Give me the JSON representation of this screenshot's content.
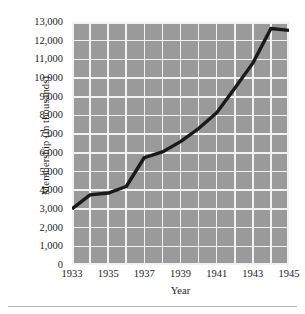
{
  "chart_data": {
    "type": "line",
    "title": "",
    "xlabel": "Year",
    "ylabel": "Membership (in thousands)",
    "x": [
      1933,
      1934,
      1935,
      1936,
      1937,
      1938,
      1939,
      1940,
      1941,
      1942,
      1943,
      1944,
      1945
    ],
    "values": [
      3000,
      3750,
      3850,
      4200,
      5750,
      6050,
      6600,
      7300,
      8150,
      9450,
      10800,
      12650,
      12550
    ],
    "series": [
      {
        "name": "Membership",
        "values": [
          3000,
          3750,
          3850,
          4200,
          5750,
          6050,
          6600,
          7300,
          8150,
          9450,
          10800,
          12650,
          12550
        ]
      }
    ],
    "xlim": [
      1933,
      1945
    ],
    "ylim": [
      0,
      13000
    ],
    "xtick_labels": [
      "1933",
      "1935",
      "1937",
      "1939",
      "1941",
      "1943",
      "1945"
    ],
    "xtick_values": [
      1933,
      1935,
      1937,
      1939,
      1941,
      1943,
      1945
    ],
    "ytick_labels": [
      "13,000",
      "12,000",
      "11,000",
      "10,000",
      "9,000",
      "8,000",
      "7,000",
      "6,000",
      "5,000",
      "4,000",
      "3,000",
      "2,000",
      "1,000",
      "0"
    ],
    "ytick_values": [
      13000,
      12000,
      11000,
      10000,
      9000,
      8000,
      7000,
      6000,
      5000,
      4000,
      3000,
      2000,
      1000,
      0
    ],
    "grid": true,
    "legend": "none",
    "colors": {
      "plot_background": "#9a9a9a",
      "gridline": "#f2f2f2",
      "line": "#1a1a1a",
      "text": "#1d1d1d",
      "page_background": "#ffffff",
      "rule": "#b9b9b9"
    },
    "line_width": 3.4
  }
}
